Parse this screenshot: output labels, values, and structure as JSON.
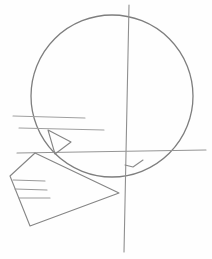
{
  "image": {
    "description": "Pencil construction sketch of a head in profile: circle cranium, vertical and horizontal guide lines, triangular eye, jaw/muzzle block with horizontal mouth lines",
    "stroke_color": "#8a8a8a",
    "background": "#fefefe"
  },
  "shapes": {
    "cranium": {
      "cx": 112,
      "cy": 96,
      "r": 80
    },
    "vertical_guide": {
      "x1": 129,
      "y1": 5,
      "x2": 124,
      "y2": 252
    },
    "horizontal_guides": [
      {
        "x1": 13,
        "y1": 116,
        "x2": 85,
        "y2": 118
      },
      {
        "x1": 19,
        "y1": 128,
        "x2": 104,
        "y2": 130
      },
      {
        "x1": 17,
        "y1": 152,
        "x2": 206,
        "y2": 150
      }
    ],
    "eye_triangle": "48,130 70,142 55,155",
    "jaw_polygon": "35,153 10,176 30,226 119,193",
    "mouth_lines": [
      {
        "x1": 13,
        "y1": 180,
        "x2": 45,
        "y2": 181
      },
      {
        "x1": 15,
        "y1": 189,
        "x2": 47,
        "y2": 190
      },
      {
        "x1": 19,
        "y1": 198,
        "x2": 50,
        "y2": 198
      }
    ],
    "ear_mark": "125,165 133,167 143,160"
  }
}
